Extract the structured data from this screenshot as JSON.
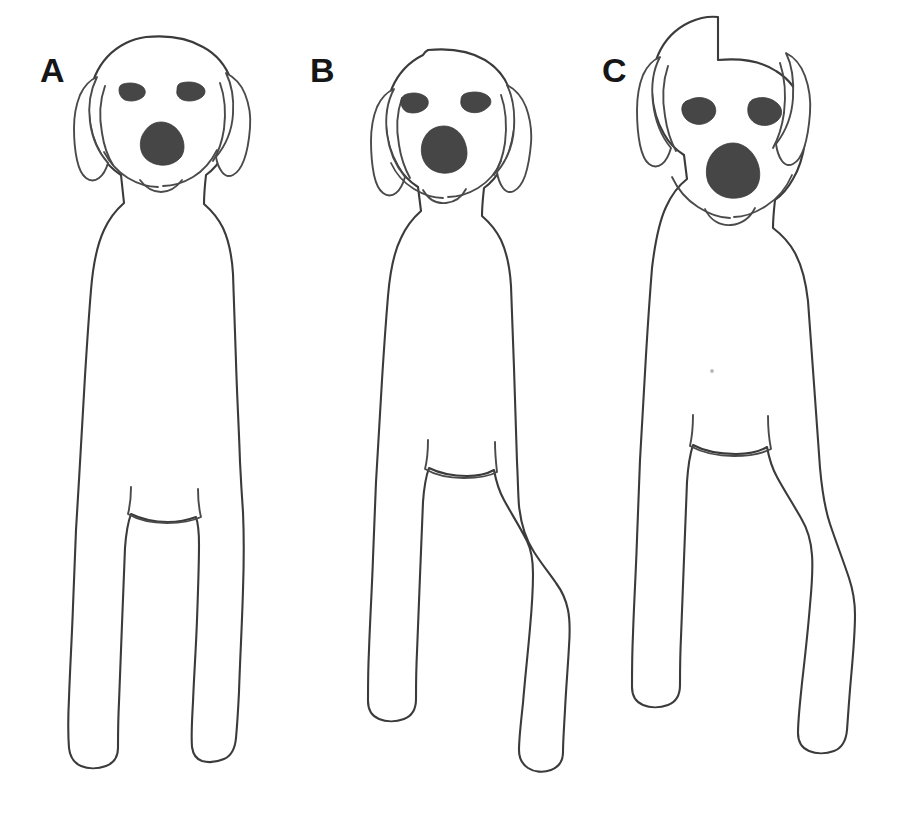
{
  "figure": {
    "background_color": "#ffffff",
    "line_color": "#3b3b3b",
    "feature_fill_color": "#464646",
    "width": 906,
    "height": 813
  },
  "panels": [
    {
      "label": "A",
      "label_x": 40,
      "label_y": 82,
      "description": "Front view line drawing of a standing dog with narrow straight body and straight parallel front legs",
      "eyes": 2,
      "ears": 2,
      "nose": 1,
      "legs": 2,
      "paws": 2
    },
    {
      "label": "B",
      "label_x": 310,
      "label_y": 82,
      "description": "Front view line drawing of a standing dog with a narrower chest and outward splayed front legs",
      "eyes": 2,
      "ears": 2,
      "nose": 1,
      "legs": 2,
      "paws": 2
    },
    {
      "label": "C",
      "label_x": 602,
      "label_y": 82,
      "description": "Front view line drawing of a standing dog with the broadest chest and right front leg angled outward",
      "eyes": 2,
      "ears": 2,
      "nose": 1,
      "legs": 2,
      "paws": 2
    }
  ]
}
